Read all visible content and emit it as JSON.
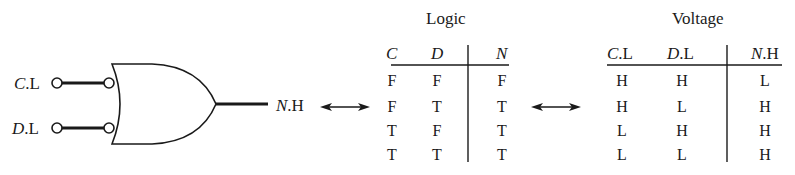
{
  "gate": {
    "type": "OR",
    "inputs": [
      {
        "signal": "C",
        "suffix": ".L"
      },
      {
        "signal": "D",
        "suffix": ".L"
      }
    ],
    "output": {
      "signal": "N",
      "suffix": ".H"
    }
  },
  "logic_table": {
    "title": "Logic",
    "headers": [
      {
        "signal": "C",
        "suffix": ""
      },
      {
        "signal": "D",
        "suffix": ""
      },
      {
        "signal": "N",
        "suffix": ""
      }
    ],
    "rows": [
      [
        "F",
        "F",
        "F"
      ],
      [
        "F",
        "T",
        "T"
      ],
      [
        "T",
        "F",
        "T"
      ],
      [
        "T",
        "T",
        "T"
      ]
    ]
  },
  "voltage_table": {
    "title": "Voltage",
    "headers": [
      {
        "signal": "C",
        "suffix": ".L"
      },
      {
        "signal": "D",
        "suffix": ".L"
      },
      {
        "signal": "N",
        "suffix": ".H"
      }
    ],
    "rows": [
      [
        "H",
        "H",
        "L"
      ],
      [
        "H",
        "L",
        "H"
      ],
      [
        "L",
        "H",
        "H"
      ],
      [
        "L",
        "L",
        "H"
      ]
    ]
  },
  "arrows": [
    "double-arrow",
    "double-arrow"
  ]
}
